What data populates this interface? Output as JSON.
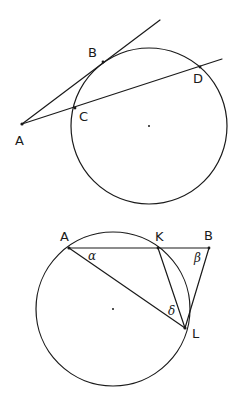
{
  "figure_top": {
    "description": "Tangent-secant from external point A to a circle",
    "circle": {
      "cx": 149,
      "cy": 126,
      "r": 78
    },
    "points": {
      "A": {
        "x": 22,
        "y": 124,
        "label": "A",
        "lx": 15,
        "ly": 145
      },
      "B": {
        "x": 103,
        "y": 62,
        "label": "B",
        "lx": 88,
        "ly": 57
      },
      "C": {
        "x": 75,
        "y": 108,
        "label": "C",
        "lx": 79,
        "ly": 121
      },
      "D": {
        "x": 200,
        "y": 67,
        "label": "D",
        "lx": 193,
        "ly": 83
      }
    },
    "tangent_end": {
      "x": 160,
      "y": 20
    },
    "secant_end": {
      "x": 222,
      "y": 59
    }
  },
  "figure_bottom": {
    "description": "Chord AK extended to B, triangle with tangent BL and chords AL, KL",
    "circle": {
      "cx": 113,
      "cy": 309,
      "r": 77
    },
    "points": {
      "A": {
        "x": 69,
        "y": 248,
        "label": "A",
        "lx": 60,
        "ly": 241
      },
      "K": {
        "x": 158,
        "y": 248,
        "label": "K",
        "lx": 155,
        "ly": 241
      },
      "B": {
        "x": 209,
        "y": 248,
        "label": "B",
        "lx": 204,
        "ly": 240
      },
      "L": {
        "x": 185,
        "y": 328,
        "label": "L",
        "lx": 192,
        "ly": 338
      }
    },
    "angles": {
      "alpha": {
        "symbol": "α",
        "x": 88,
        "y": 260
      },
      "beta": {
        "symbol": "β",
        "x": 194,
        "y": 262
      },
      "delta": {
        "symbol": "δ",
        "x": 168,
        "y": 315
      }
    }
  }
}
